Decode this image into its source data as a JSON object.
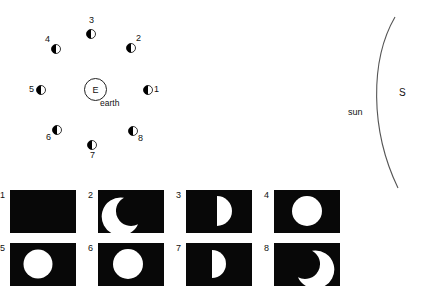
{
  "diagram": {
    "title_visible": false,
    "earth": {
      "letter": "E",
      "label": "earth",
      "name": "earth-marker"
    },
    "sun": {
      "label": "sun",
      "letter": "S",
      "arc": "curved-limb"
    },
    "orbit_positions": [
      {
        "num": "1",
        "angle_deg": 0,
        "label_pos": "right",
        "x": 148,
        "y": 90,
        "moon_glyph": "half-dark-left"
      },
      {
        "num": "2",
        "angle_deg": 45,
        "label_pos": "tr",
        "x": 131,
        "y": 48,
        "moon_glyph": "half-dark-left"
      },
      {
        "num": "3",
        "angle_deg": 90,
        "label_pos": "top",
        "x": 91,
        "y": 34,
        "moon_glyph": "half-dark-left"
      },
      {
        "num": "4",
        "angle_deg": 135,
        "label_pos": "tl",
        "x": 56,
        "y": 49,
        "moon_glyph": "half-dark-left"
      },
      {
        "num": "5",
        "angle_deg": 180,
        "label_pos": "left",
        "x": 41,
        "y": 90,
        "moon_glyph": "half-dark-left"
      },
      {
        "num": "6",
        "angle_deg": 225,
        "label_pos": "bl",
        "x": 57,
        "y": 130,
        "moon_glyph": "half-dark-left"
      },
      {
        "num": "7",
        "angle_deg": 270,
        "label_pos": "bottom",
        "x": 92,
        "y": 145,
        "moon_glyph": "half-dark-left"
      },
      {
        "num": "8",
        "angle_deg": 315,
        "label_pos": "br",
        "x": 133,
        "y": 131,
        "moon_glyph": "half-dark-left"
      }
    ]
  },
  "phase_panels": {
    "background_color": "#080808",
    "lit_color": "#ffffff",
    "cells": [
      {
        "num": "1",
        "phase": "new-moon",
        "illumination_pct": 0
      },
      {
        "num": "2",
        "phase": "waxing-crescent",
        "illumination_pct": 15
      },
      {
        "num": "3",
        "phase": "first-quarter",
        "illumination_pct": 50
      },
      {
        "num": "4",
        "phase": "waxing-gibbous",
        "illumination_pct": 78
      },
      {
        "num": "5",
        "phase": "full-moon",
        "illumination_pct": 100
      },
      {
        "num": "6",
        "phase": "waning-gibbous",
        "illumination_pct": 78
      },
      {
        "num": "7",
        "phase": "last-quarter",
        "illumination_pct": 50
      },
      {
        "num": "8",
        "phase": "waning-crescent",
        "illumination_pct": 15
      }
    ]
  }
}
